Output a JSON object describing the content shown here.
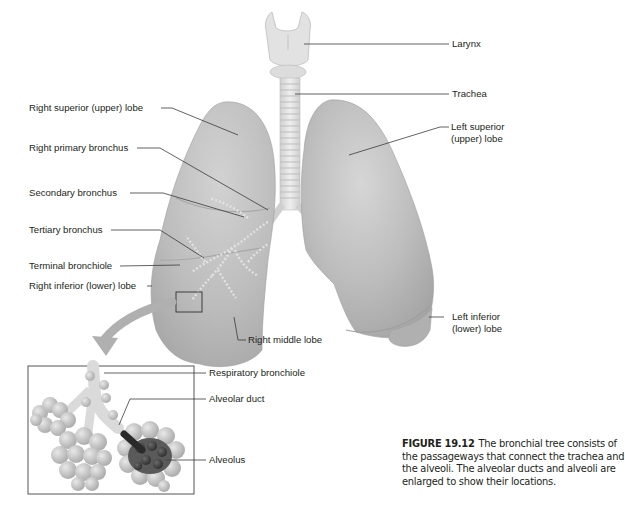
{
  "figure": {
    "number": "FIGURE 19.12",
    "caption": "The bronchial tree consists of the passageways that connect the trachea and the alveoli. The alveolar ducts and alveoli are enlarged to show their locations."
  },
  "labels": {
    "larynx": "Larynx",
    "trachea": "Trachea",
    "left_superior_lobe_line1": "Left superior",
    "left_superior_lobe_line2": "(upper) lobe",
    "left_inferior_lobe_line1": "Left inferior",
    "left_inferior_lobe_line2": "(lower) lobe",
    "right_superior_lobe": "Right superior (upper) lobe",
    "right_primary_bronchus": "Right primary bronchus",
    "secondary_bronchus": "Secondary bronchus",
    "tertiary_bronchus": "Tertiary bronchus",
    "terminal_bronchiole": "Terminal bronchiole",
    "right_inferior_lobe": "Right inferior (lower) lobe",
    "right_middle_lobe": "Right middle lobe",
    "respiratory_bronchiole": "Respiratory bronchiole",
    "alveolar_duct": "Alveolar duct",
    "alveolus": "Alveolus"
  },
  "colors": {
    "lung_fill": "#b9b9b9",
    "lung_shadow": "#9a9a9a",
    "lung_highlight": "#d8d8d8",
    "trachea": "#e4e4e4",
    "leader_line": "#3a3a3a",
    "inset_frame": "#555555",
    "arrow": "#a8a8a8",
    "alveolus_dark": "#4a4a4a"
  }
}
